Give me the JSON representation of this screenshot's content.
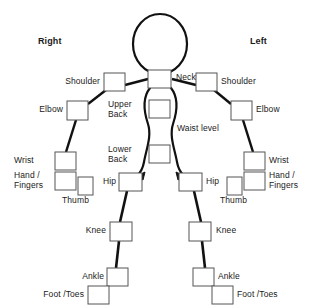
{
  "diagram": {
    "headers": {
      "right": "Right",
      "left": "Left"
    },
    "colors": {
      "outline": "#111111",
      "box_stroke": "#555555",
      "text": "#1a1a1a",
      "background": "#ffffff"
    },
    "center_labels": {
      "neck": "Neck",
      "upper_back": "Upper\nBack",
      "lower_back": "Lower\nBack",
      "waist_level": "Waist level"
    },
    "right_side": {
      "shoulder": "Shoulder",
      "elbow": "Elbow",
      "wrist": "Wrist",
      "hand_fingers": "Hand /\nFingers",
      "thumb": "Thumb",
      "hip": "Hip",
      "knee": "Knee",
      "ankle": "Ankle",
      "foot_toes": "Foot /Toes"
    },
    "left_side": {
      "shoulder": "Shoulder",
      "elbow": "Elbow",
      "wrist": "Wrist",
      "hand_fingers": "Hand /\nFingers",
      "thumb": "Thumb",
      "hip": "Hip",
      "knee": "Knee",
      "ankle": "Ankle",
      "foot_toes": "Foot /Toes"
    },
    "checkbox_count": 22
  }
}
